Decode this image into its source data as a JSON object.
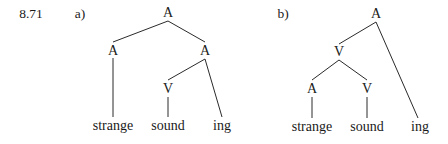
{
  "example_number": "8.71",
  "trees": [
    {
      "label": "a)",
      "nodes": [
        {
          "id": "a_root",
          "text": "A",
          "x": 168,
          "y": 13
        },
        {
          "id": "a_left_A",
          "text": "A",
          "x": 113,
          "y": 51
        },
        {
          "id": "a_right_A",
          "text": "A",
          "x": 205,
          "y": 51
        },
        {
          "id": "a_V",
          "text": "V",
          "x": 168,
          "y": 89
        }
      ],
      "leaves": [
        {
          "id": "a_strange",
          "text": "strange",
          "x": 113,
          "y": 126
        },
        {
          "id": "a_sound",
          "text": "sound",
          "x": 168,
          "y": 126
        },
        {
          "id": "a_ing",
          "text": "ing",
          "x": 222,
          "y": 126
        }
      ]
    },
    {
      "label": "b)",
      "nodes": [
        {
          "id": "b_root",
          "text": "A",
          "x": 376,
          "y": 14
        },
        {
          "id": "b_V",
          "text": "V",
          "x": 339,
          "y": 52
        },
        {
          "id": "b_A",
          "text": "A",
          "x": 312,
          "y": 89
        },
        {
          "id": "b_V2",
          "text": "V",
          "x": 367,
          "y": 89
        }
      ],
      "leaves": [
        {
          "id": "b_strange",
          "text": "strange",
          "x": 312,
          "y": 127
        },
        {
          "id": "b_sound",
          "text": "sound",
          "x": 367,
          "y": 127
        },
        {
          "id": "b_ing",
          "text": "ing",
          "x": 420,
          "y": 127
        }
      ]
    }
  ]
}
